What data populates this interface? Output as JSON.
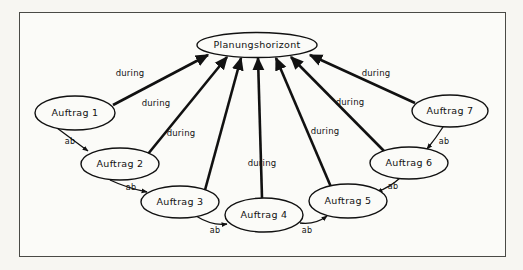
{
  "figure": {
    "kind": "directed-graph-diagram",
    "language": "de",
    "frame": {
      "stroke_color": "#4a4a46",
      "background_color": "#fbfbf8"
    },
    "page_background": "#f7f6f2",
    "ink_color": "#111111"
  },
  "nodes": [
    {
      "id": "planungshorizont",
      "label": "Planungshorizont",
      "cx": 257,
      "cy": 45,
      "rx": 60,
      "ry": 12.5
    },
    {
      "id": "auftrag1",
      "label": "Auftrag 1",
      "cx": 75,
      "cy": 113,
      "rx": 40,
      "ry": 17
    },
    {
      "id": "auftrag2",
      "label": "Auftrag 2",
      "cx": 120,
      "cy": 164,
      "rx": 39,
      "ry": 16
    },
    {
      "id": "auftrag3",
      "label": "Auftrag 3",
      "cx": 180,
      "cy": 202,
      "rx": 39,
      "ry": 16
    },
    {
      "id": "auftrag4",
      "label": "Auftrag 4",
      "cx": 264,
      "cy": 215,
      "rx": 39,
      "ry": 17
    },
    {
      "id": "auftrag5",
      "label": "Auftrag 5",
      "cx": 348,
      "cy": 201,
      "rx": 39,
      "ry": 17
    },
    {
      "id": "auftrag6",
      "label": "Auftrag 6",
      "cx": 409,
      "cy": 163,
      "rx": 39,
      "ry": 16
    },
    {
      "id": "auftrag7",
      "label": "Auftrag 7",
      "cx": 450,
      "cy": 111,
      "rx": 38,
      "ry": 16
    }
  ],
  "edges": [
    {
      "id": "e1",
      "from": "auftrag1",
      "to": "planungshorizont",
      "label": "during",
      "label_x": 130,
      "label_y": 73,
      "weight": "thick"
    },
    {
      "id": "e2",
      "from": "auftrag2",
      "to": "planungshorizont",
      "label": "during",
      "label_x": 156,
      "label_y": 103,
      "weight": "thick"
    },
    {
      "id": "e3",
      "from": "auftrag3",
      "to": "planungshorizont",
      "label": "during",
      "label_x": 181,
      "label_y": 133,
      "weight": "thick"
    },
    {
      "id": "e4",
      "from": "auftrag4",
      "to": "planungshorizont",
      "label": "during",
      "label_x": 262,
      "label_y": 163,
      "weight": "thick"
    },
    {
      "id": "e5",
      "from": "auftrag5",
      "to": "planungshorizont",
      "label": "during",
      "label_x": 325,
      "label_y": 131,
      "weight": "thick"
    },
    {
      "id": "e6",
      "from": "auftrag6",
      "to": "planungshorizont",
      "label": "during",
      "label_x": 350,
      "label_y": 102,
      "weight": "thick"
    },
    {
      "id": "e7",
      "from": "auftrag7",
      "to": "planungshorizont",
      "label": "during",
      "label_x": 376,
      "label_y": 73,
      "weight": "thick"
    },
    {
      "id": "a12",
      "from": "auftrag1",
      "to": "auftrag2",
      "label": "ab",
      "label_x": 70,
      "label_y": 142,
      "weight": "thin"
    },
    {
      "id": "a23",
      "from": "auftrag2",
      "to": "auftrag3",
      "label": "ab",
      "label_x": 131,
      "label_y": 188,
      "weight": "thin"
    },
    {
      "id": "a34",
      "from": "auftrag3",
      "to": "auftrag4",
      "label": "ab",
      "label_x": 215,
      "label_y": 231,
      "weight": "thin"
    },
    {
      "id": "a45",
      "from": "auftrag4",
      "to": "auftrag5",
      "label": "ab",
      "label_x": 307,
      "label_y": 231,
      "weight": "thin"
    },
    {
      "id": "a65",
      "from": "auftrag6",
      "to": "auftrag5",
      "label": "ab",
      "label_x": 393,
      "label_y": 187,
      "weight": "thin"
    },
    {
      "id": "a76",
      "from": "auftrag7",
      "to": "auftrag6",
      "label": "ab",
      "label_x": 444,
      "label_y": 142,
      "weight": "thin"
    }
  ]
}
